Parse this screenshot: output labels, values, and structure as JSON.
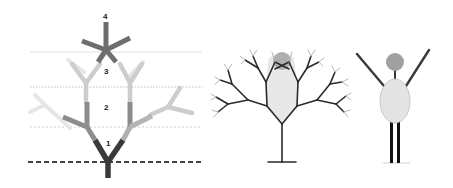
{
  "diagram": {
    "panels": [
      {
        "id": "branching-levels",
        "description": "Branching tree with numbered levels separated by dashed lines",
        "levels": [
          "1",
          "2",
          "3",
          "4"
        ],
        "colors": {
          "level1": "#3a3a3a",
          "level2": "#8a8a8a",
          "level3": "#c8c8c8",
          "level4": "#e2e2e2",
          "top_star": "#6e6e6e",
          "base_dashed": "#444444",
          "divider_dashed": "#bdbdbd"
        }
      },
      {
        "id": "fractal-tree",
        "description": "Fractal tree with overlaid oval body and circular head",
        "colors": {
          "branches": "#2a2a2a",
          "body": "#e6e6e6",
          "head": "#a8a8a8"
        }
      },
      {
        "id": "stick-figure",
        "description": "Stick figure with raised arms, oval body, circular head, two legs",
        "colors": {
          "limbs": "#3a3a3a",
          "body": "#e4e4e4",
          "head": "#a0a0a0",
          "legs": "#111111"
        }
      }
    ]
  }
}
